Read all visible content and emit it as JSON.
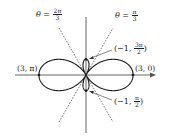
{
  "diagram": {
    "type": "polar-curve",
    "equation_described": "r = 1 + 2cos(2θ)",
    "axes": {
      "horizontal_arrow": true,
      "vertical_arrow": false
    },
    "labels": {
      "line_left": {
        "prefix": "θ = ",
        "num": "2π",
        "den": "3"
      },
      "line_right": {
        "prefix": "θ = ",
        "num": "π",
        "den": "3"
      },
      "point_top": {
        "open": "(−1, ",
        "num": "3π",
        "den": "2",
        "close": ")"
      },
      "point_bottom": {
        "open": "(−1, ",
        "num": "π",
        "den": "2",
        "close": ")"
      },
      "point_left": "(3, π)",
      "point_right": "(3, 0)"
    },
    "colors": {
      "curve": "#1a1a1a",
      "axis": "#555555",
      "dashed": "#444444"
    }
  }
}
